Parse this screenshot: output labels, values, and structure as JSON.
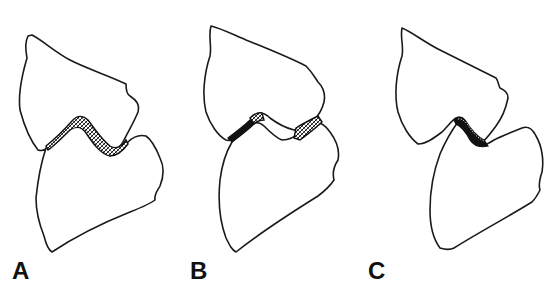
{
  "figure": {
    "panels": [
      {
        "id": "A",
        "label": "A",
        "variant": "continuous hatched cartilage band along the full S-shaped joint surface"
      },
      {
        "id": "B",
        "label": "B",
        "variant": "joint space widened; hatched cartilage patches at the two ends with open gap between surfaces"
      },
      {
        "id": "C",
        "label": "C",
        "variant": "short, dark, narrow hatched cartilage segment at the center of the joint"
      }
    ]
  },
  "colors": {
    "line": "#1a1a1a",
    "background": "#ffffff",
    "hatch": "#111111"
  }
}
